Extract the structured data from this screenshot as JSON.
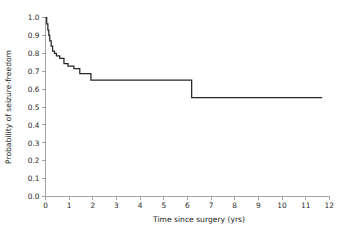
{
  "chart_data": {
    "type": "line",
    "title": "",
    "subtitle": "",
    "xlabel": "Time since surgery (yrs)",
    "ylabel": "Probability of seizure-freedom",
    "xlim": [
      0,
      12
    ],
    "ylim": [
      0.0,
      1.0
    ],
    "grid": false,
    "legend": null,
    "curve_style": "kaplan-meier step function",
    "xticks": [
      0,
      1,
      2,
      3,
      4,
      5,
      6,
      7,
      8,
      9,
      10,
      11,
      12
    ],
    "xtick_labels": [
      "0",
      "1",
      "2",
      "3",
      "4",
      "5",
      "6",
      "7",
      "8",
      "9",
      "10",
      "11",
      "12"
    ],
    "yticks": [
      0.0,
      0.1,
      0.2,
      0.3,
      0.4,
      0.5,
      0.6,
      0.7,
      0.8,
      0.9,
      1.0
    ],
    "ytick_labels": [
      "0.0",
      "0.1",
      "0.2",
      "0.3",
      "0.4",
      "0.5",
      "0.6",
      "0.7",
      "0.8",
      "0.9",
      "1.0"
    ],
    "series": [
      {
        "name": "Seizure-freedom survival",
        "color": "#262626",
        "x": [
          0.0,
          0.05,
          0.05,
          0.1,
          0.1,
          0.14,
          0.14,
          0.18,
          0.18,
          0.24,
          0.24,
          0.3,
          0.3,
          0.38,
          0.38,
          0.46,
          0.46,
          0.6,
          0.6,
          0.78,
          0.78,
          0.95,
          0.95,
          1.2,
          1.2,
          1.45,
          1.45,
          1.92,
          1.92,
          6.18,
          6.18,
          11.7
        ],
        "y": [
          1.0,
          1.0,
          0.965,
          0.965,
          0.93,
          0.93,
          0.9,
          0.9,
          0.87,
          0.87,
          0.84,
          0.84,
          0.812,
          0.812,
          0.8,
          0.8,
          0.786,
          0.786,
          0.772,
          0.772,
          0.742,
          0.742,
          0.728,
          0.728,
          0.714,
          0.714,
          0.686,
          0.686,
          0.65,
          0.65,
          0.552,
          0.552
        ]
      }
    ],
    "annotations": [
      {
        "label": "initial steep decline",
        "x_range": [
          0.0,
          0.5
        ],
        "y_range": [
          1.0,
          0.8
        ]
      },
      {
        "label": "plateau after 2 yrs",
        "x_range": [
          1.92,
          6.18
        ],
        "y": 0.65
      },
      {
        "label": "late drop at ~6.2 yrs",
        "x": 6.18,
        "y_from": 0.65,
        "y_to": 0.552
      },
      {
        "label": "final plateau",
        "x_range": [
          6.18,
          11.7
        ],
        "y": 0.552
      }
    ]
  },
  "figure": {
    "axis_color": "#9a9a9a",
    "curve_color": "#262626",
    "background": "#ffffff"
  }
}
